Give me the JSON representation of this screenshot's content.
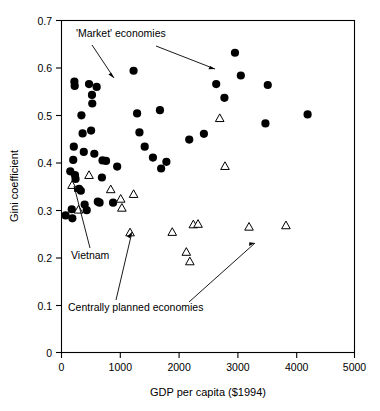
{
  "chart_data": {
    "type": "scatter",
    "title": "",
    "xlabel": "GDP per capita ($1994)",
    "ylabel": "Gini coefficient",
    "xlim": [
      0,
      5000
    ],
    "ylim": [
      0,
      0.7
    ],
    "xticks": [
      0,
      1000,
      2000,
      3000,
      4000,
      5000
    ],
    "xtick_labels": [
      "0",
      "1000",
      "2000",
      "3000",
      "4000",
      "5000"
    ],
    "yticks": [
      0,
      0.1,
      0.2,
      0.3,
      0.4,
      0.5,
      0.6,
      0.7
    ],
    "ytick_labels": [
      "0",
      "0.1",
      "0.2",
      "0.3",
      "0.4",
      "0.5",
      "0.6",
      "0.7"
    ],
    "grid": false,
    "legend": "none",
    "series": [
      {
        "name": "'Market' economies",
        "marker": "filled-circle",
        "color": "#000000",
        "points": [
          [
            70,
            0.289
          ],
          [
            150,
            0.382
          ],
          [
            175,
            0.302
          ],
          [
            185,
            0.283
          ],
          [
            200,
            0.406
          ],
          [
            210,
            0.434
          ],
          [
            220,
            0.571
          ],
          [
            225,
            0.562
          ],
          [
            230,
            0.374
          ],
          [
            240,
            0.366
          ],
          [
            300,
            0.345
          ],
          [
            330,
            0.341
          ],
          [
            340,
            0.5
          ],
          [
            360,
            0.462
          ],
          [
            380,
            0.423
          ],
          [
            395,
            0.312
          ],
          [
            430,
            0.3
          ],
          [
            470,
            0.566
          ],
          [
            505,
            0.468
          ],
          [
            520,
            0.543
          ],
          [
            525,
            0.525
          ],
          [
            560,
            0.419
          ],
          [
            600,
            0.56
          ],
          [
            620,
            0.318
          ],
          [
            650,
            0.316
          ],
          [
            690,
            0.369
          ],
          [
            700,
            0.405
          ],
          [
            760,
            0.404
          ],
          [
            880,
            0.316
          ],
          [
            950,
            0.392
          ],
          [
            1230,
            0.594
          ],
          [
            1290,
            0.504
          ],
          [
            1330,
            0.464
          ],
          [
            1420,
            0.434
          ],
          [
            1560,
            0.411
          ],
          [
            1680,
            0.511
          ],
          [
            1700,
            0.388
          ],
          [
            1790,
            0.402
          ],
          [
            2180,
            0.449
          ],
          [
            2430,
            0.461
          ],
          [
            2640,
            0.566
          ],
          [
            2780,
            0.537
          ],
          [
            2960,
            0.632
          ],
          [
            3060,
            0.584
          ],
          [
            3480,
            0.483
          ],
          [
            3520,
            0.564
          ],
          [
            4200,
            0.502
          ]
        ]
      },
      {
        "name": "Centrally planned economies",
        "marker": "open-triangle",
        "color": "#000000",
        "points": [
          [
            180,
            0.353
          ],
          [
            290,
            0.301
          ],
          [
            470,
            0.374
          ],
          [
            840,
            0.344
          ],
          [
            1010,
            0.324
          ],
          [
            1030,
            0.305
          ],
          [
            1170,
            0.253
          ],
          [
            1230,
            0.334
          ],
          [
            1890,
            0.254
          ],
          [
            2130,
            0.212
          ],
          [
            2190,
            0.192
          ],
          [
            2250,
            0.27
          ],
          [
            2330,
            0.271
          ],
          [
            2700,
            0.494
          ],
          [
            2790,
            0.393
          ],
          [
            3200,
            0.265
          ],
          [
            3830,
            0.268
          ]
        ]
      }
    ],
    "annotations": [
      {
        "id": "market-economies-label",
        "text": "'Market' economies",
        "arrows": 2
      },
      {
        "id": "vietnam-label",
        "text": "Vietnam",
        "arrows": 1,
        "points_to": [
          180,
          0.353
        ]
      },
      {
        "id": "centrally-planned-label",
        "text": "Centrally planned economies",
        "arrows": 2
      }
    ]
  },
  "axes": {
    "x_title": "GDP per capita ($1994)",
    "y_title": "Gini coefficient",
    "x_labels": [
      "0",
      "1000",
      "2000",
      "3000",
      "4000",
      "5000"
    ],
    "y_labels": [
      "0.7",
      "0.6",
      "0.5",
      "0.4",
      "0.3",
      "0.2",
      "0.1",
      "0"
    ]
  },
  "labels": {
    "market": "'Market' economies",
    "vietnam": "Vietnam",
    "planned": "Centrally planned economies"
  }
}
